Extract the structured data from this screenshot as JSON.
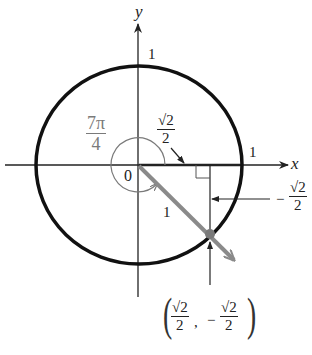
{
  "diagram": {
    "axes": {
      "x_label": "x",
      "y_label": "y",
      "origin_label": "0"
    },
    "tick_labels": {
      "x_one": "1",
      "y_one": "1"
    },
    "angle": {
      "numerator": "7π",
      "denominator": "4"
    },
    "radius_label": "1",
    "x_coord": {
      "numerator": "√2",
      "denominator": "2"
    },
    "y_coord": {
      "sign": "−",
      "numerator": "√2",
      "denominator": "2"
    },
    "point": {
      "x": {
        "numerator": "√2",
        "denominator": "2"
      },
      "comma": ",",
      "y_sign": "−",
      "y": {
        "numerator": "√2",
        "denominator": "2"
      }
    },
    "colors": {
      "circle": "#111111",
      "axes": "#222222",
      "radius_vector": "#8a8a8a",
      "angle_arc": "#7a7a7a",
      "point": "#7a7a7a"
    }
  }
}
